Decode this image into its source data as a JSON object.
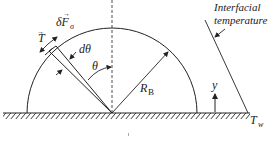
{
  "diagram": {
    "title": "",
    "labels": {
      "tension": "T",
      "surface_force": "δF",
      "surface_force_sub": "σ",
      "d_theta": "dθ",
      "theta": "θ",
      "radius": "R",
      "radius_sub": "B",
      "y_axis": "y",
      "wall_temp": "T",
      "wall_temp_sub": "w",
      "interfacial_line1": "Interfacial",
      "interfacial_line2": "temperature"
    },
    "colors": {
      "stroke": "#222222",
      "background": "#ffffff"
    }
  }
}
